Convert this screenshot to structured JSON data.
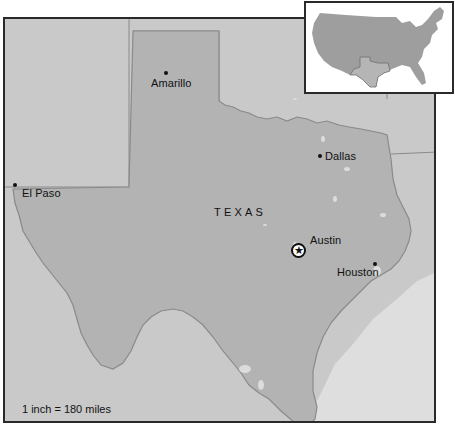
{
  "map": {
    "state_label": "TEXAS",
    "cities": [
      {
        "name": "Amarillo",
        "type": "city"
      },
      {
        "name": "Dallas",
        "type": "city"
      },
      {
        "name": "El Paso",
        "type": "city"
      },
      {
        "name": "Austin",
        "type": "capital"
      },
      {
        "name": "Houston",
        "type": "city"
      }
    ],
    "scale_text": "1 inch = 180 miles",
    "colors": {
      "texas_fill": "#b3b3b3",
      "neighbor_fill": "#c9c9c9",
      "water_fill": "#dedede",
      "border_line": "#8a8a8a",
      "frame": "#2a2a2a"
    }
  },
  "inset": {
    "description": "Locator map of the contiguous United States with Texas highlighted",
    "highlighted_state": "Texas"
  }
}
